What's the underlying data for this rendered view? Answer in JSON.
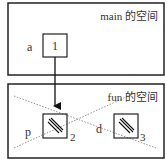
{
  "main_space": {
    "title": "main 的空间",
    "variable": {
      "name": "a",
      "value": "1"
    }
  },
  "fun_space": {
    "title": "fun 的空间",
    "destroyed": true,
    "variables": [
      {
        "name": "p",
        "value_hatched": true,
        "address_label": "2"
      },
      {
        "name": "d",
        "value_hatched": true,
        "address_label": "3"
      }
    ]
  },
  "arrow": {
    "from": "main.a",
    "to": "fun.p"
  },
  "colors": {
    "stroke": "#222222",
    "cross": "#888888",
    "background": "#ffffff"
  }
}
